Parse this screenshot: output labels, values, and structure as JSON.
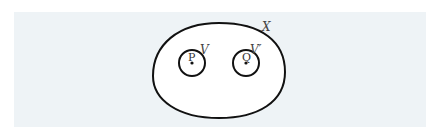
{
  "diagram": {
    "space_label": "X",
    "neighborhoods": [
      {
        "label": "V",
        "point_label": "P"
      },
      {
        "label": "V′",
        "point_label": "Q"
      }
    ],
    "colors": {
      "background_panel": "#eef3f6",
      "region_fill": "#ffffff",
      "stroke": "#111111",
      "label": "#444444"
    }
  }
}
